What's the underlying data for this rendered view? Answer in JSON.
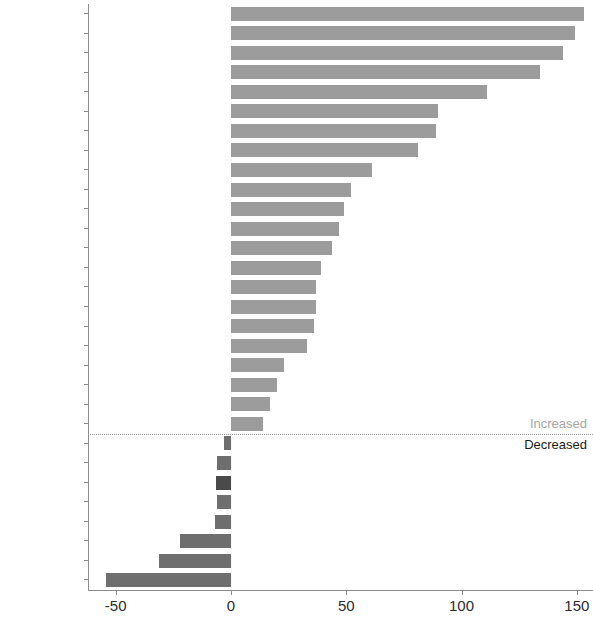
{
  "chart_data": {
    "type": "bar",
    "orientation": "horizontal",
    "title": "",
    "subtitle": "",
    "xlabel": "",
    "ylabel": "",
    "xlim": [
      -62,
      157
    ],
    "xticks": [
      -50,
      0,
      50,
      100,
      150
    ],
    "xtick_labels": [
      "-50",
      "0",
      "50",
      "100",
      "150"
    ],
    "grid": false,
    "legend_position": "inline-right",
    "categories": [
      "Cyprus",
      "Lithuania",
      "Latvia",
      "Estonia",
      "Bulgaria",
      "France",
      "Japan",
      "Portugal",
      "Finland",
      "Austria",
      "Hungary",
      "Norway",
      "Denmark",
      "Ireland",
      "Chile",
      "Poland",
      "Spain",
      "Germany",
      "Netherlands",
      "Croatia",
      "New Zealand",
      "Switzerland",
      "Canada",
      "UK",
      "Australia",
      "US",
      "Sweden",
      "Luxembourg",
      "Czechia",
      "Iceland"
    ],
    "values": [
      153,
      149,
      144,
      134,
      111,
      90,
      89,
      81,
      61,
      52,
      49,
      47,
      44,
      39,
      37,
      37,
      36,
      33,
      23,
      20,
      17,
      14,
      -3,
      -6,
      -6.5,
      -6,
      -7,
      -22,
      -31,
      -54
    ],
    "highlighted_category": "Australia",
    "annotations": [
      {
        "text": "Increased",
        "position": "above-divider-right"
      },
      {
        "text": "Decreased",
        "position": "below-divider-right"
      }
    ],
    "colors": {
      "positive_bar": "#9c9c9c",
      "negative_bar": "#6e6e6e",
      "highlight_bar": "#4a4a4a",
      "axis": "#8c8c8c",
      "divider": "#9a9a9a",
      "increased_label": "#a6a6a6",
      "decreased_label": "#1a1a1a",
      "tick_text": "#2b2b2b",
      "background": "#ffffff"
    }
  },
  "annotations": {
    "increased": "Increased",
    "decreased": "Decreased"
  }
}
